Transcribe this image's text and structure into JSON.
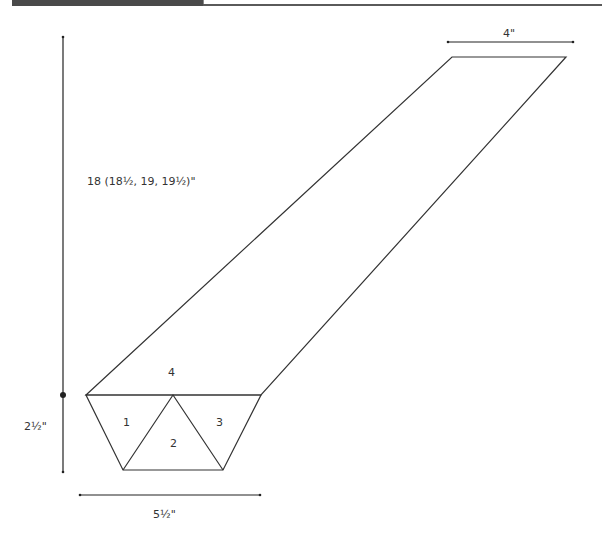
{
  "header": {
    "bar_color": "#4a4a4a",
    "rule_color": "#5a5a5a"
  },
  "diagram": {
    "line_color": "#333333",
    "dimensions": {
      "top_width": "4\"",
      "length": "18 (18½, 19, 19½)\"",
      "section_height": "2½\"",
      "bottom_width": "5½\""
    },
    "pieces": [
      {
        "id": "1",
        "label": "1"
      },
      {
        "id": "2",
        "label": "2"
      },
      {
        "id": "3",
        "label": "3"
      },
      {
        "id": "4",
        "label": "4"
      }
    ]
  }
}
